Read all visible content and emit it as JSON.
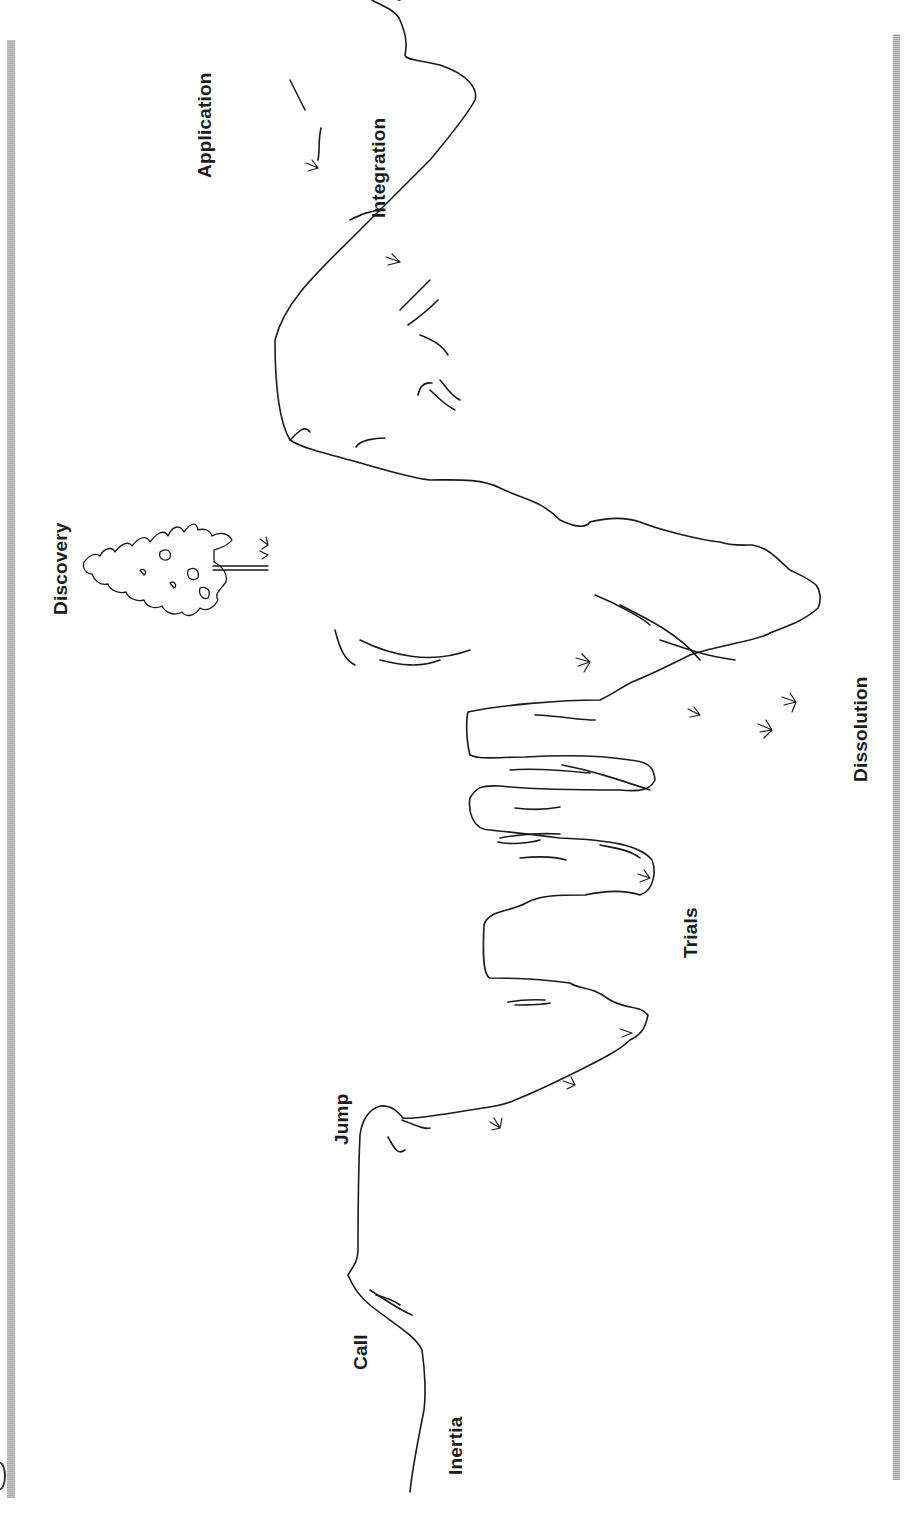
{
  "diagram": {
    "type": "journey-path",
    "orientation": "rotated-90-ccw",
    "line_color": "#1a1a1a",
    "border_color": "#b4b4b4",
    "stages": [
      {
        "id": "inertia",
        "label": "Inertia"
      },
      {
        "id": "call",
        "label": "Call"
      },
      {
        "id": "jump",
        "label": "Jump"
      },
      {
        "id": "trials",
        "label": "Trials"
      },
      {
        "id": "dissolution",
        "label": "Dissolution"
      },
      {
        "id": "discovery",
        "label": "Discovery"
      },
      {
        "id": "integration",
        "label": "Integration"
      },
      {
        "id": "application",
        "label": "Application"
      }
    ],
    "illustrations": [
      {
        "id": "tree",
        "icon": "pine-tree-icon",
        "location": "discovery-summit"
      }
    ]
  }
}
